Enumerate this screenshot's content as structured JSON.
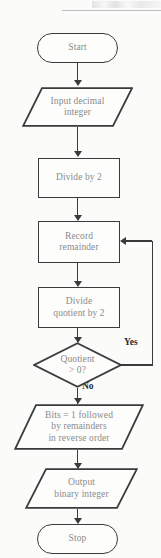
{
  "page": {
    "header_ghost_text": "",
    "background_color": "#fbfbfa",
    "stroke_color": "#3b3b3d",
    "node_text_color": "#8b8b8d",
    "edge_label_color": "#2c2c2e"
  },
  "flowchart": {
    "title": "Decimal to binary conversion flowchart",
    "nodes": [
      {
        "id": "start",
        "type": "terminator",
        "label": "Start"
      },
      {
        "id": "input",
        "type": "io",
        "label": "Input decimal\ninteger",
        "line1": "Input decimal",
        "line2": "integer"
      },
      {
        "id": "divide",
        "type": "process",
        "label": "Divide by 2"
      },
      {
        "id": "record",
        "type": "process",
        "label": "Record\nremainder",
        "line1": "Record",
        "line2": "remainder"
      },
      {
        "id": "divide_quot",
        "type": "process",
        "label": "Divide\nquotient by 2",
        "line1": "Divide",
        "line2": "quotient by 2"
      },
      {
        "id": "decision",
        "type": "decision",
        "label": "Quotient\n> 0?",
        "line1": "Quotient",
        "line2": "> 0?"
      },
      {
        "id": "bits",
        "type": "io",
        "label": "Bits = 1 followed by remainders in reverse order",
        "line1": "Bits = 1 followed",
        "line2": "by remainders",
        "line3": "in reverse order"
      },
      {
        "id": "output",
        "type": "io",
        "label": "Output\nbinary integer",
        "line1": "Output",
        "line2": "binary integer"
      },
      {
        "id": "stop",
        "type": "terminator",
        "label": "Stop"
      }
    ],
    "edge_labels": {
      "yes": "Yes",
      "no": "No"
    }
  }
}
